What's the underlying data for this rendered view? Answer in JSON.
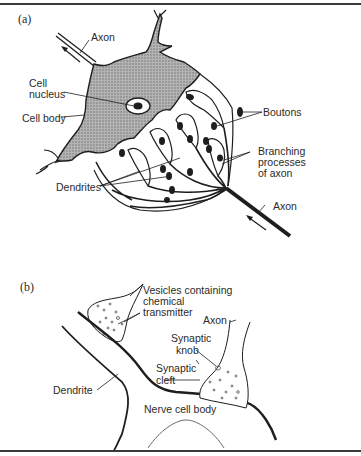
{
  "figure": {
    "panel_a": {
      "label": "(a)",
      "annotations": {
        "axon_top": "Axon",
        "cell_nucleus_line1": "Cell",
        "cell_nucleus_line2": "nucleus",
        "cell_body": "Cell body",
        "boutons": "Boutons",
        "branching_line1": "Branching",
        "branching_line2": "processes",
        "branching_line3": "of axon",
        "dendrites": "Dendrites",
        "axon_bottom": "Axon"
      }
    },
    "panel_b": {
      "label": "(b)",
      "annotations": {
        "vesicles_line1": "Vesicles containing",
        "vesicles_line2": "chemical",
        "vesicles_line3": "transmitter",
        "axon": "Axon",
        "synaptic_knob_line1": "Synaptic",
        "synaptic_knob_line2": "knob",
        "synaptic_cleft_line1": "Synaptic",
        "synaptic_cleft_line2": "cleft",
        "dendrite": "Dendrite",
        "nerve_cell_body": "Nerve cell body"
      }
    },
    "colors": {
      "ink": "#1e1e1e",
      "cell_fill": "#a8a8a8",
      "background": "#ffffff"
    }
  }
}
